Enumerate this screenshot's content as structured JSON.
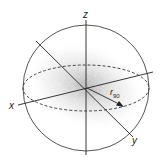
{
  "diagram": {
    "axes": {
      "x": "x",
      "y": "y",
      "z": "z"
    },
    "radius_label": {
      "main": "r",
      "subscript": "90"
    },
    "colors": {
      "stroke": "#333333",
      "cloud": "#9a9a9a",
      "background": "#ffffff"
    }
  }
}
